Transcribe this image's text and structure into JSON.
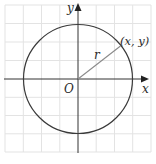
{
  "diagram": {
    "labels": {
      "y_axis": "y",
      "x_axis": "x",
      "origin": "O",
      "radius": "r",
      "point": "(x, y)"
    },
    "colors": {
      "grid": "#e3e3e3",
      "axis": "#333333",
      "circle": "#3a3a3a",
      "radius_line": "#8a8a8a",
      "background": "#ffffff"
    },
    "geometry": {
      "center": [
        78,
        79
      ],
      "radius_px": 54,
      "point_angle_deg": 37,
      "grid_spacing_px": 18.2
    }
  }
}
